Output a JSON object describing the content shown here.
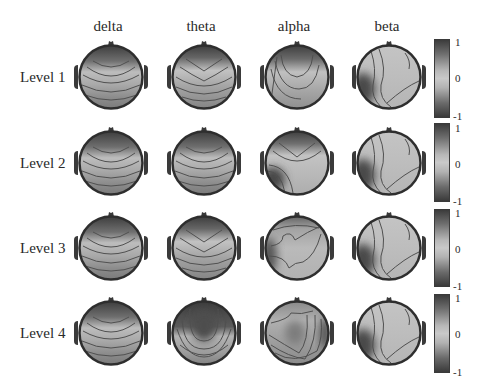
{
  "chart_data": {
    "type": "heatmap",
    "title": "",
    "subtitle": "EEG scalp topographic maps per frequency band and level",
    "columns": [
      "delta",
      "theta",
      "alpha",
      "beta"
    ],
    "rows": [
      "Level 1",
      "Level 2",
      "Level 3",
      "Level 4"
    ],
    "colorbar": {
      "ticks": [
        "1",
        "0",
        "-1"
      ],
      "range": [
        -1,
        1
      ],
      "colormap": "grayscale (dark = ±1, light = 0)"
    },
    "maps": [
      [
        {
          "band": "delta",
          "level": "Level 1",
          "pattern": "frontal-dark",
          "desc": "dark frontal cap, bands curve downward toward posterior"
        },
        {
          "band": "theta",
          "level": "Level 1",
          "pattern": "frontal-v",
          "desc": "dark frontal V, lighter midline, curved bands"
        },
        {
          "band": "alpha",
          "level": "Level 1",
          "pattern": "frontal-u",
          "desc": "dark frontal U, contours sweeping down left"
        },
        {
          "band": "beta",
          "level": "Level 1",
          "pattern": "left-temporal-dark",
          "desc": "dark left-temporal blob, mostly uniform light"
        }
      ],
      [
        {
          "band": "delta",
          "level": "Level 2",
          "pattern": "frontal-dark",
          "desc": "dark frontal cap, layered curved bands"
        },
        {
          "band": "theta",
          "level": "Level 2",
          "pattern": "frontal-dark",
          "desc": "dark frontal cap, bands with dip at posterior"
        },
        {
          "band": "alpha",
          "level": "Level 2",
          "pattern": "frontal-v-leftdark",
          "desc": "frontal V with dark left-posterior blob"
        },
        {
          "band": "beta",
          "level": "Level 2",
          "pattern": "left-temporal-dark",
          "desc": "dark left-temporal, diagonal contour to right"
        }
      ],
      [
        {
          "band": "delta",
          "level": "Level 3",
          "pattern": "frontal-dark",
          "desc": "dark frontal cap, curved bands"
        },
        {
          "band": "theta",
          "level": "Level 3",
          "pattern": "frontal-v",
          "desc": "dark frontal V, curved bands"
        },
        {
          "band": "alpha",
          "level": "Level 3",
          "pattern": "irregular",
          "desc": "irregular central plateau, dark left edge"
        },
        {
          "band": "beta",
          "level": "Level 3",
          "pattern": "left-temporal-dark",
          "desc": "dark left-temporal blob, wavy contour"
        }
      ],
      [
        {
          "band": "delta",
          "level": "Level 4",
          "pattern": "frontal-dark",
          "desc": "dark frontal cap, U-shaped bands"
        },
        {
          "band": "theta",
          "level": "Level 4",
          "pattern": "frontal-u-deep",
          "desc": "deep dark frontal-central U"
        },
        {
          "band": "alpha",
          "level": "Level 4",
          "pattern": "diagonal",
          "desc": "diagonal bands, dark right strip, darker center blob"
        },
        {
          "band": "beta",
          "level": "Level 4",
          "pattern": "left-temporal-dark",
          "desc": "dark left edge, cross contours"
        }
      ]
    ],
    "legend_position": "right (one colorbar per row)",
    "grid": false
  },
  "headers": [
    "delta",
    "theta",
    "alpha",
    "beta"
  ],
  "row_labels": [
    "Level 1",
    "Level 2",
    "Level 3",
    "Level 4"
  ],
  "colorbar_ticks": {
    "top": "1",
    "mid": "0",
    "bottom": "-1"
  }
}
